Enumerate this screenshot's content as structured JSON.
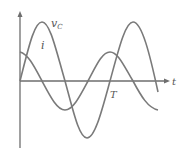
{
  "diagram": {
    "type": "waveform",
    "axes": {
      "x_label": "t",
      "y_label": ""
    },
    "curves": [
      {
        "name": "v_C",
        "label_main": "v",
        "label_sub": "C",
        "color": "#7a7a7a",
        "amplitude": "large",
        "phase": "starts at zero rising"
      },
      {
        "name": "i",
        "label_main": "i",
        "color": "#7a7a7a",
        "amplitude": "small",
        "phase": "starts at positive maximum"
      }
    ],
    "markers": [
      {
        "label": "T",
        "meaning": "period"
      }
    ]
  }
}
